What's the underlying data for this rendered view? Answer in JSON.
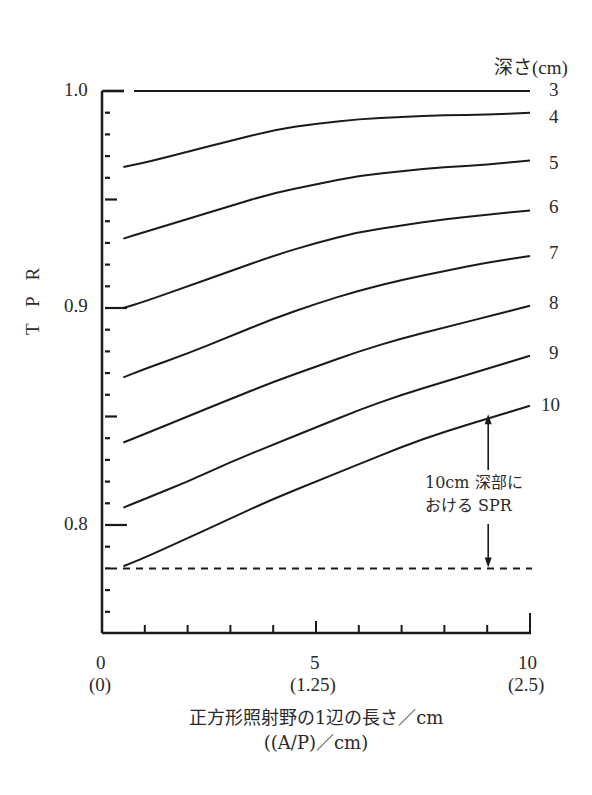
{
  "chart_data": {
    "type": "line",
    "title": "",
    "xlabel": "正方形照射野の1辺の長さ／cm",
    "xlabel_secondary": "((A/P)／cm)",
    "ylabel": "T P R",
    "legend_title": "深さ(cm)",
    "xlim": [
      0,
      10
    ],
    "ylim": [
      0.75,
      1.0
    ],
    "grid": false,
    "x_ticks": [
      {
        "value": 0,
        "label": "0",
        "sub": "(0)"
      },
      {
        "value": 5,
        "label": "5",
        "sub": "(1.25)"
      },
      {
        "value": 10,
        "label": "10",
        "sub": "(2.5)"
      }
    ],
    "y_ticks": [
      {
        "value": 1.0,
        "label": "1.0"
      },
      {
        "value": 0.9,
        "label": "0.9"
      },
      {
        "value": 0.8,
        "label": "0.8"
      }
    ],
    "x": [
      0.5,
      1,
      2,
      3,
      4,
      5,
      6,
      7,
      8,
      9,
      10
    ],
    "series": [
      {
        "name": "3",
        "values": [
          1.0,
          1.0,
          1.0,
          1.0,
          1.0,
          1.0,
          1.0,
          1.0,
          1.0,
          1.0,
          1.0
        ]
      },
      {
        "name": "4",
        "values": [
          0.965,
          0.967,
          0.972,
          0.977,
          0.982,
          0.985,
          0.987,
          0.988,
          0.989,
          0.989,
          0.99
        ]
      },
      {
        "name": "5",
        "values": [
          0.932,
          0.935,
          0.941,
          0.947,
          0.953,
          0.957,
          0.961,
          0.963,
          0.965,
          0.966,
          0.968
        ]
      },
      {
        "name": "6",
        "values": [
          0.9,
          0.903,
          0.91,
          0.917,
          0.924,
          0.93,
          0.935,
          0.938,
          0.941,
          0.943,
          0.945
        ]
      },
      {
        "name": "7",
        "values": [
          0.868,
          0.872,
          0.879,
          0.887,
          0.895,
          0.902,
          0.908,
          0.913,
          0.917,
          0.921,
          0.924
        ]
      },
      {
        "name": "8",
        "values": [
          0.838,
          0.842,
          0.85,
          0.858,
          0.866,
          0.873,
          0.88,
          0.886,
          0.891,
          0.896,
          0.901
        ]
      },
      {
        "name": "9",
        "values": [
          0.808,
          0.812,
          0.82,
          0.829,
          0.837,
          0.845,
          0.853,
          0.86,
          0.866,
          0.872,
          0.878
        ]
      },
      {
        "name": "10",
        "values": [
          0.781,
          0.785,
          0.794,
          0.803,
          0.812,
          0.82,
          0.828,
          0.836,
          0.843,
          0.849,
          0.855
        ]
      }
    ],
    "reference_lines": [
      {
        "name": "TPR at zero field, 10cm",
        "y": 0.78,
        "style": "dashed"
      }
    ],
    "annotations": [
      {
        "text": "10cm 深部における SPR",
        "x": 9,
        "y_from": 0.78,
        "y_to": 0.852,
        "style": "double-arrow"
      }
    ]
  },
  "labels": {
    "legend_title": "深さ(cm)",
    "depths": [
      "3",
      "4",
      "5",
      "6",
      "7",
      "8",
      "9",
      "10"
    ],
    "y_axis_title": "T P R",
    "y_ticks": [
      "1.0",
      "0.9",
      "0.8"
    ],
    "x_ticks": [
      "0",
      "5",
      "10"
    ],
    "x_ticks_sub": [
      "(0)",
      "(1.25)",
      "(2.5)"
    ],
    "x_title_1": "正方形照射野の1辺の長さ／cm",
    "x_title_2": "((A/P)／cm)",
    "annotation_1": "10cm 深部に",
    "annotation_2": "おける SPR"
  }
}
